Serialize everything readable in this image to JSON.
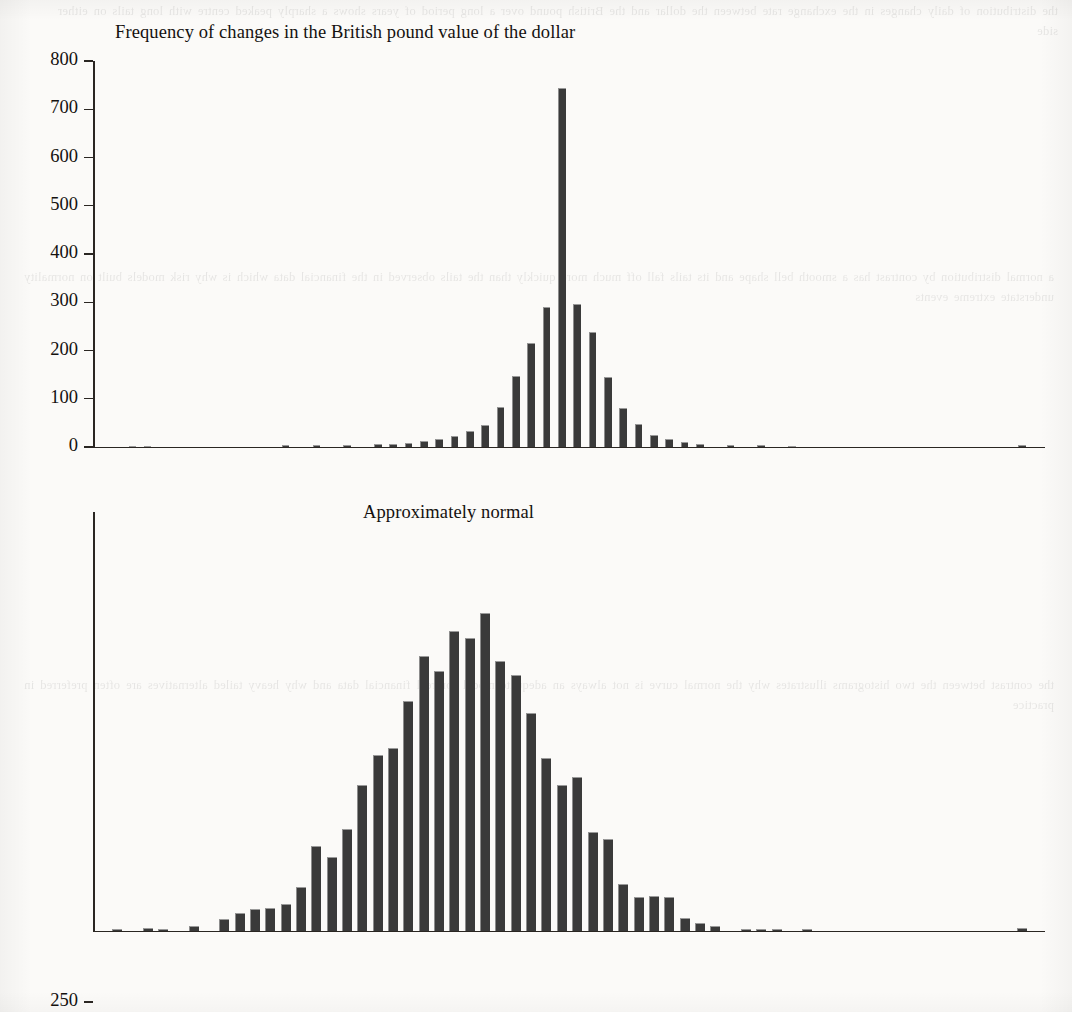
{
  "page": {
    "background_color": "#fbfaf8",
    "ink_color": "#14110f",
    "bar_color": "#3a3a3a"
  },
  "ghost_text": {
    "top": "the distribution of daily changes in the exchange rate between the dollar and the British pound over a long period of years shows a sharply peaked centre with long tails on either side",
    "middle": "a normal distribution by contrast has a smooth bell shape and its tails fall off much more quickly than the tails observed in the financial data which is why risk models built on normality understate extreme events",
    "lower": "the contrast between the two histograms illustrates why the normal curve is not always an adequate model for real financial data and why heavy tailed alternatives are often preferred in practice"
  },
  "chart_data": [
    {
      "id": "pound-dollar-changes",
      "type": "bar",
      "title": "Frequency of changes in the British pound value of the dollar",
      "xlabel": "",
      "ylabel": "",
      "ylim": [
        0,
        800
      ],
      "yticks": [
        0,
        100,
        200,
        300,
        400,
        500,
        600,
        700,
        800
      ],
      "ytick_labels": [
        "0",
        "100",
        "200",
        "300",
        "400",
        "500",
        "600",
        "700",
        "800"
      ],
      "grid": false,
      "legend": "none",
      "n_slots": 62,
      "bar_slot_indices": [
        2,
        3,
        12,
        14,
        16,
        18,
        19,
        20,
        21,
        22,
        23,
        24,
        25,
        26,
        27,
        28,
        29,
        30,
        31,
        32,
        33,
        34,
        35,
        36,
        37,
        38,
        39,
        41,
        43,
        45,
        60
      ],
      "values": [
        2,
        2,
        4,
        4,
        5,
        7,
        7,
        9,
        13,
        17,
        23,
        33,
        46,
        83,
        148,
        216,
        290,
        745,
        297,
        238,
        146,
        80,
        47,
        25,
        17,
        11,
        7,
        5,
        4,
        3,
        4
      ]
    },
    {
      "id": "approximately-normal",
      "type": "bar",
      "title": "Approximately normal",
      "xlabel": "",
      "ylabel": "",
      "ylim": [
        0,
        250
      ],
      "yticks": [
        0,
        50,
        100,
        150,
        200,
        250
      ],
      "ytick_labels": [
        "0",
        "50",
        "100",
        "150",
        "200",
        "250"
      ],
      "grid": false,
      "legend": "none",
      "n_slots": 62,
      "bar_slot_indices": [
        1,
        3,
        4,
        6,
        8,
        9,
        10,
        11,
        12,
        13,
        14,
        15,
        16,
        17,
        18,
        19,
        20,
        21,
        22,
        23,
        24,
        25,
        26,
        27,
        28,
        29,
        30,
        31,
        32,
        33,
        34,
        35,
        36,
        37,
        38,
        39,
        40,
        42,
        43,
        44,
        46,
        60
      ],
      "values": [
        1,
        2,
        1,
        3,
        7,
        11,
        13,
        14,
        16,
        26,
        51,
        44,
        61,
        87,
        105,
        109,
        137,
        164,
        155,
        179,
        175,
        190,
        161,
        153,
        130,
        103,
        87,
        92,
        59,
        55,
        28,
        20,
        21,
        20,
        8,
        5,
        3,
        1,
        1,
        1,
        1,
        2
      ]
    }
  ]
}
